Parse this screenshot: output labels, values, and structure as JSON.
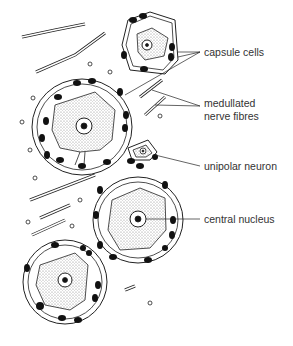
{
  "figure": {
    "labels": [
      {
        "id": "capsule-cells",
        "text": "capsule cells",
        "x": 204,
        "y": 46
      },
      {
        "id": "medullated",
        "text": "medullated",
        "x": 204,
        "y": 97
      },
      {
        "id": "nerve-fibres",
        "text": "nerve fibres",
        "x": 204,
        "y": 110
      },
      {
        "id": "unipolar-neuron",
        "text": "unipolar neuron",
        "x": 204,
        "y": 160
      },
      {
        "id": "central-nucleus",
        "text": "central nucleus",
        "x": 204,
        "y": 213
      }
    ]
  }
}
